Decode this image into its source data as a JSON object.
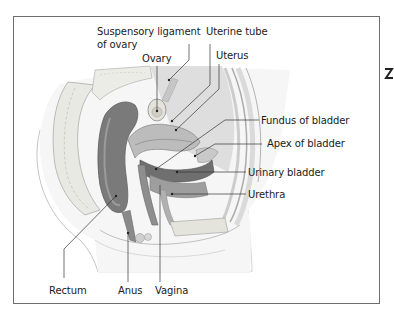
{
  "diagram": {
    "frame_color": "#6e6e6e",
    "labels": [
      {
        "id": "suspensory-ligament",
        "text_line1": "Suspensory ligament",
        "text_line2": "of ovary"
      },
      {
        "id": "ovary",
        "text": "Ovary"
      },
      {
        "id": "uterine-tube",
        "text": "Uterine tube"
      },
      {
        "id": "uterus",
        "text": "Uterus"
      },
      {
        "id": "fundus-of-bladder",
        "text": "Fundus of bladder"
      },
      {
        "id": "apex-of-bladder",
        "text": "Apex of bladder"
      },
      {
        "id": "urinary-bladder",
        "text": "Urinary bladder"
      },
      {
        "id": "urethra",
        "text": "Urethra"
      },
      {
        "id": "rectum",
        "text": "Rectum"
      },
      {
        "id": "anus",
        "text": "Anus"
      },
      {
        "id": "vagina",
        "text": "Vagina"
      }
    ]
  }
}
